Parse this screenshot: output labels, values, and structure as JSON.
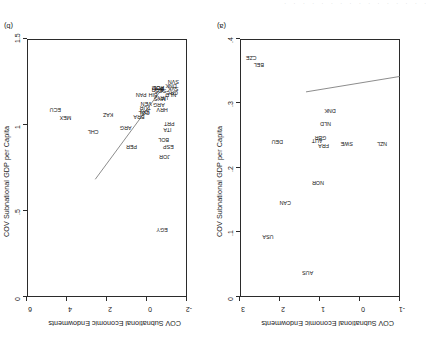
{
  "figure": {
    "rotation_note": "180",
    "cut_text_top": ". . . . . . . . . . . . . . . ."
  },
  "panels": [
    {
      "tag": "(a)",
      "tag_name": "panel-tag-a",
      "chart_data": {
        "type": "scatter",
        "title": "",
        "xlabel": "COV Subnational GDP per Capita",
        "ylabel": "COV Subnational Economic Endowments",
        "xlim": [
          0,
          0.4
        ],
        "ylim": [
          -1,
          3
        ],
        "xticks": [
          "0",
          ".1",
          ".2",
          ".3",
          ".4"
        ],
        "xtick_values": [
          0,
          0.1,
          0.2,
          0.3,
          0.4
        ],
        "yticks": [
          "-1",
          "0",
          "1",
          "2",
          "3"
        ],
        "ytick_values": [
          -1,
          0,
          1,
          2,
          3
        ],
        "grid": false,
        "legend": "none",
        "fit_line": {
          "x0": 0.0,
          "y0": -0.42,
          "x1": 0.235,
          "y1": -0.18
        },
        "points": [
          {
            "label": "NZL",
            "x": 0.045,
            "y": 0.62
          },
          {
            "label": "SWE",
            "x": 0.133,
            "y": 0.62
          },
          {
            "label": "DNK",
            "x": 0.175,
            "y": 0.1
          },
          {
            "label": "NLD",
            "x": 0.186,
            "y": 0.3
          },
          {
            "label": "FRA",
            "x": 0.191,
            "y": 0.64
          },
          {
            "label": "GBR",
            "x": 0.199,
            "y": 0.52
          },
          {
            "label": "AUT",
            "x": 0.207,
            "y": 0.56
          },
          {
            "label": "NOR",
            "x": 0.205,
            "y": 1.22
          },
          {
            "label": "AUS",
            "x": 0.231,
            "y": 2.62
          },
          {
            "label": "CAN",
            "x": 0.287,
            "y": 1.52
          },
          {
            "label": "DEU",
            "x": 0.307,
            "y": 0.58
          },
          {
            "label": "USA",
            "x": 0.33,
            "y": 2.06
          },
          {
            "label": "BEL",
            "x": 0.353,
            "y": -0.62
          },
          {
            "label": "CZE",
            "x": 0.372,
            "y": -0.72
          }
        ]
      }
    },
    {
      "tag": "(b)",
      "tag_name": "panel-tag-b",
      "chart_data": {
        "type": "scatter",
        "title": "",
        "xlabel": "COV Subnational GDP per Capita",
        "ylabel": "COV Subnational Economic Endowments",
        "xlim": [
          0,
          1.5
        ],
        "ylim": [
          -2,
          6
        ],
        "xticks": [
          "0",
          ".5",
          "1",
          "1.5"
        ],
        "xtick_values": [
          0,
          0.5,
          1,
          1.5
        ],
        "yticks": [
          "-2",
          "0",
          "2",
          "4",
          "6"
        ],
        "ytick_values": [
          -2,
          0,
          2,
          4,
          6
        ],
        "grid": false,
        "legend": "none",
        "fit_line": {
          "x0": 0.235,
          "y0": -0.45,
          "x1": 0.86,
          "y1": 2.35
        },
        "points": [
          {
            "label": "SVN",
            "x": 0.128,
            "y": -0.7
          },
          {
            "label": "SVK",
            "x": 0.13,
            "y": -0.48
          },
          {
            "label": "GRC",
            "x": 0.14,
            "y": -0.36
          },
          {
            "label": "DNK",
            "x": 0.15,
            "y": -0.56
          },
          {
            "label": "NLD",
            "x": 0.152,
            "y": -0.28
          },
          {
            "label": "PRT",
            "x": 0.167,
            "y": 0.6
          },
          {
            "label": "ESP",
            "x": 0.175,
            "y": 1.32
          },
          {
            "label": "ITA",
            "x": 0.183,
            "y": 0.78
          },
          {
            "label": "JOR",
            "x": 0.21,
            "y": 1.62
          },
          {
            "label": "BOL",
            "x": 0.219,
            "y": 1.1
          },
          {
            "label": "EGY",
            "x": 0.233,
            "y": 3.9
          },
          {
            "label": "URY",
            "x": 0.232,
            "y": -0.2
          },
          {
            "label": "HRV",
            "x": 0.233,
            "y": 0.18
          },
          {
            "label": "SCG",
            "x": 0.25,
            "y": -0.42
          },
          {
            "label": "MYS",
            "x": 0.255,
            "y": -0.16
          },
          {
            "label": "ARG",
            "x": 0.264,
            "y": 0.02
          },
          {
            "label": "POL",
            "x": 0.268,
            "y": -0.5
          },
          {
            "label": "ROM",
            "x": 0.272,
            "y": -0.52
          },
          {
            "label": "BGR",
            "x": 0.276,
            "y": -0.44
          },
          {
            "label": "BIH",
            "x": 0.318,
            "y": -0.3
          },
          {
            "label": "VEN",
            "x": 0.382,
            "y": -0.02
          },
          {
            "label": "TUR",
            "x": 0.392,
            "y": 0.1
          },
          {
            "label": "IDN",
            "x": 0.396,
            "y": 0.22
          },
          {
            "label": "COL",
            "x": 0.402,
            "y": 0.26
          },
          {
            "label": "PAN",
            "x": 0.43,
            "y": -0.28
          },
          {
            "label": "BRA",
            "x": 0.45,
            "y": 0.4
          },
          {
            "label": "PER",
            "x": 0.52,
            "y": 1.32
          },
          {
            "label": "ARG",
            "x": 0.575,
            "y": 0.72
          },
          {
            "label": "KAZ",
            "x": 0.74,
            "y": 0.32
          },
          {
            "label": "CHL",
            "x": 0.88,
            "y": 0.86
          },
          {
            "label": "MEX",
            "x": 1.14,
            "y": 0.42
          },
          {
            "label": "ECU",
            "x": 1.235,
            "y": 0.16
          }
        ]
      }
    }
  ]
}
